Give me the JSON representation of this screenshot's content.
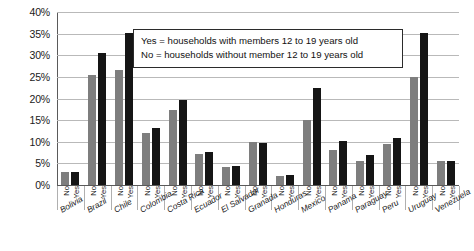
{
  "chart_data": {
    "type": "bar",
    "title": "",
    "xlabel": "",
    "ylabel": "",
    "ylim": [
      0,
      40
    ],
    "ytick_labels": [
      "40%",
      "35%",
      "30%",
      "25%",
      "20%",
      "15%",
      "10%",
      "5%",
      "0%"
    ],
    "ytick_values": [
      40,
      35,
      30,
      25,
      20,
      15,
      10,
      5,
      0
    ],
    "grid": true,
    "grid_axis": "y",
    "legend_position": "inside-top-center",
    "categories": [
      "Bolivia",
      "Brazil",
      "Chile",
      "Colombia",
      "Costa Rica",
      "Ecuador",
      "El Salvador",
      "Granada",
      "Honduras",
      "Mexico",
      "Panama",
      "Paraguay",
      "Peru",
      "Uruguay",
      "Venezuela"
    ],
    "group_labels": [
      "No",
      "Yes"
    ],
    "series": [
      {
        "name": "No",
        "color": "#7e7e7e",
        "values": [
          3.1,
          25.5,
          26.6,
          12.0,
          17.4,
          7.2,
          4.1,
          9.9,
          2.2,
          15.0,
          8.0,
          5.6,
          9.5,
          25.0,
          5.6
        ]
      },
      {
        "name": "Yes",
        "color": "#151515",
        "values": [
          3.1,
          30.6,
          35.2,
          13.2,
          19.6,
          7.7,
          4.4,
          9.6,
          2.3,
          22.4,
          10.2,
          6.9,
          10.8,
          35.2,
          5.6
        ]
      }
    ],
    "annotations": [
      "Yes = households with members 12 to 19 years old",
      "No = households without member 12 to 19 years old"
    ]
  },
  "legend": {
    "line1": "Yes = households with members 12 to 19 years old",
    "line2": "No = households without member 12 to 19 years old"
  },
  "colors": {
    "bar_no": "#7e7e7e",
    "bar_yes": "#151515",
    "gridline": "#b9b9b9",
    "axis": "#5a5a5a",
    "background": "#ffffff"
  }
}
